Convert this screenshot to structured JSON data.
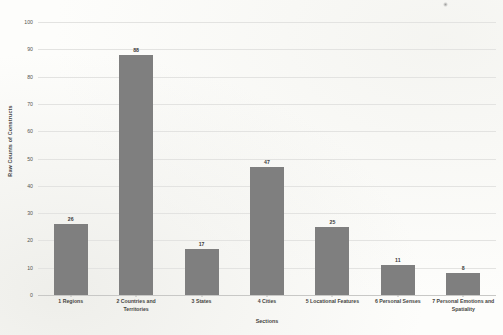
{
  "chart_data": {
    "type": "bar",
    "title": "",
    "xlabel": "Sections",
    "ylabel": "Raw Counts of Constructs",
    "categories": [
      "1 Regions",
      "2 Countries and Territories",
      "3 States",
      "4 Cities",
      "5 Locational Features",
      "6 Personal Senses",
      "7 Personal Emotions and Spatiality"
    ],
    "values": [
      26,
      88,
      17,
      47,
      25,
      11,
      8
    ],
    "data_labels": [
      "26",
      "88",
      "17",
      "47",
      "25",
      "11",
      "8"
    ],
    "ylim": [
      0,
      100
    ],
    "ytick_labels": [
      "100",
      "90",
      "80",
      "70",
      "60",
      "50",
      "40",
      "30",
      "20",
      "10",
      "0"
    ],
    "ytick_values": [
      100,
      90,
      80,
      70,
      60,
      50,
      40,
      30,
      20,
      10,
      0
    ],
    "ytick_step": 10,
    "grid": "horizontal",
    "legend": "none",
    "bar_color": "#7f7f7f",
    "gridline_color": "#e3e3e1",
    "background_color": "#fdfdfb"
  }
}
